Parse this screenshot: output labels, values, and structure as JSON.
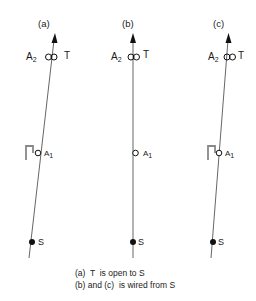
{
  "panels": [
    {
      "id": "a",
      "title": "(a)",
      "top_label_left": "A",
      "top_label_left_sub": "2",
      "top_label_right": "T",
      "mid_label": "A",
      "mid_label_sub": "1",
      "bottom_label": "S"
    },
    {
      "id": "b",
      "title": "(b)",
      "top_label_left": "A",
      "top_label_left_sub": "2",
      "top_label_right": "T",
      "mid_label": "A",
      "mid_label_sub": "1",
      "bottom_label": "S"
    },
    {
      "id": "c",
      "title": "(c)",
      "top_label_left": "A",
      "top_label_left_sub": "2",
      "top_label_right": "T",
      "mid_label": "A",
      "mid_label_sub": "1",
      "bottom_label": "S"
    }
  ],
  "caption": {
    "line1": "(a)  T  is open to S",
    "line2": "(b) and (c)  is wired from S"
  },
  "colors": {
    "line": "#555555",
    "ink": "#111111"
  }
}
